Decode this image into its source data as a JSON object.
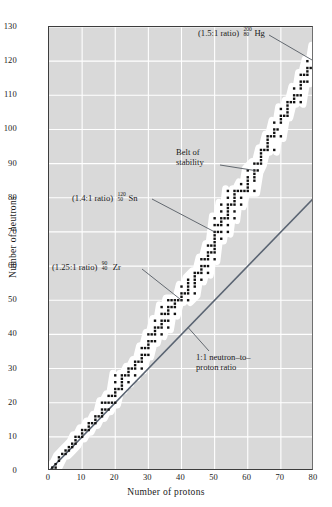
{
  "chart_data": {
    "type": "scatter",
    "title": "",
    "xlabel": "Number of protons",
    "ylabel": "Number of neutrons",
    "xlim": [
      0,
      80
    ],
    "ylim": [
      0,
      130
    ],
    "xticks": [
      0,
      10,
      20,
      30,
      40,
      50,
      60,
      70,
      80
    ],
    "yticks": [
      0,
      10,
      20,
      30,
      40,
      50,
      60,
      70,
      80,
      90,
      100,
      110,
      120,
      130
    ],
    "grid": true,
    "legend": "none",
    "background": "#d9d9d9",
    "gridline_color": "#ffffff",
    "point_color": "#111111",
    "band_color": "#ffffff",
    "reference_line_color": "#5a6472",
    "series": [
      {
        "name": "belt of stability (stable nuclides)",
        "note": "Z = protons, N = neutrons for stable isotopes",
        "points": [
          [
            1,
            0
          ],
          [
            1,
            1
          ],
          [
            2,
            1
          ],
          [
            2,
            2
          ],
          [
            3,
            3
          ],
          [
            3,
            4
          ],
          [
            4,
            5
          ],
          [
            5,
            5
          ],
          [
            5,
            6
          ],
          [
            6,
            6
          ],
          [
            6,
            7
          ],
          [
            7,
            7
          ],
          [
            7,
            8
          ],
          [
            8,
            8
          ],
          [
            8,
            9
          ],
          [
            8,
            10
          ],
          [
            9,
            10
          ],
          [
            10,
            10
          ],
          [
            10,
            11
          ],
          [
            10,
            12
          ],
          [
            11,
            12
          ],
          [
            12,
            12
          ],
          [
            12,
            13
          ],
          [
            12,
            14
          ],
          [
            13,
            14
          ],
          [
            14,
            14
          ],
          [
            14,
            15
          ],
          [
            14,
            16
          ],
          [
            15,
            16
          ],
          [
            16,
            16
          ],
          [
            16,
            17
          ],
          [
            16,
            18
          ],
          [
            16,
            20
          ],
          [
            17,
            18
          ],
          [
            17,
            20
          ],
          [
            18,
            18
          ],
          [
            18,
            20
          ],
          [
            18,
            22
          ],
          [
            19,
            20
          ],
          [
            19,
            22
          ],
          [
            20,
            20
          ],
          [
            20,
            22
          ],
          [
            20,
            23
          ],
          [
            20,
            24
          ],
          [
            20,
            26
          ],
          [
            20,
            28
          ],
          [
            21,
            24
          ],
          [
            22,
            24
          ],
          [
            22,
            25
          ],
          [
            22,
            26
          ],
          [
            22,
            27
          ],
          [
            22,
            28
          ],
          [
            23,
            28
          ],
          [
            24,
            26
          ],
          [
            24,
            28
          ],
          [
            24,
            29
          ],
          [
            24,
            30
          ],
          [
            25,
            30
          ],
          [
            26,
            28
          ],
          [
            26,
            30
          ],
          [
            26,
            31
          ],
          [
            26,
            32
          ],
          [
            27,
            32
          ],
          [
            28,
            30
          ],
          [
            28,
            32
          ],
          [
            28,
            33
          ],
          [
            28,
            34
          ],
          [
            28,
            36
          ],
          [
            29,
            34
          ],
          [
            29,
            36
          ],
          [
            30,
            34
          ],
          [
            30,
            36
          ],
          [
            30,
            37
          ],
          [
            30,
            38
          ],
          [
            30,
            40
          ],
          [
            31,
            38
          ],
          [
            31,
            40
          ],
          [
            32,
            38
          ],
          [
            32,
            40
          ],
          [
            32,
            41
          ],
          [
            32,
            42
          ],
          [
            32,
            44
          ],
          [
            33,
            42
          ],
          [
            34,
            40
          ],
          [
            34,
            42
          ],
          [
            34,
            43
          ],
          [
            34,
            44
          ],
          [
            34,
            46
          ],
          [
            34,
            48
          ],
          [
            35,
            44
          ],
          [
            35,
            46
          ],
          [
            36,
            42
          ],
          [
            36,
            44
          ],
          [
            36,
            46
          ],
          [
            36,
            47
          ],
          [
            36,
            48
          ],
          [
            36,
            50
          ],
          [
            37,
            48
          ],
          [
            37,
            50
          ],
          [
            38,
            46
          ],
          [
            38,
            48
          ],
          [
            38,
            49
          ],
          [
            38,
            50
          ],
          [
            39,
            50
          ],
          [
            40,
            50
          ],
          [
            40,
            51
          ],
          [
            40,
            52
          ],
          [
            40,
            54
          ],
          [
            41,
            52
          ],
          [
            42,
            50
          ],
          [
            42,
            52
          ],
          [
            42,
            53
          ],
          [
            42,
            54
          ],
          [
            42,
            55
          ],
          [
            42,
            56
          ],
          [
            44,
            52
          ],
          [
            44,
            54
          ],
          [
            44,
            55
          ],
          [
            44,
            56
          ],
          [
            44,
            57
          ],
          [
            44,
            58
          ],
          [
            45,
            58
          ],
          [
            46,
            56
          ],
          [
            46,
            58
          ],
          [
            46,
            59
          ],
          [
            46,
            60
          ],
          [
            46,
            62
          ],
          [
            47,
            60
          ],
          [
            47,
            62
          ],
          [
            48,
            58
          ],
          [
            48,
            60
          ],
          [
            48,
            62
          ],
          [
            48,
            63
          ],
          [
            48,
            64
          ],
          [
            48,
            66
          ],
          [
            49,
            64
          ],
          [
            49,
            66
          ],
          [
            50,
            62
          ],
          [
            50,
            64
          ],
          [
            50,
            65
          ],
          [
            50,
            66
          ],
          [
            50,
            67
          ],
          [
            50,
            68
          ],
          [
            50,
            69
          ],
          [
            50,
            70
          ],
          [
            50,
            72
          ],
          [
            50,
            74
          ],
          [
            51,
            70
          ],
          [
            51,
            72
          ],
          [
            52,
            68
          ],
          [
            52,
            70
          ],
          [
            52,
            72
          ],
          [
            52,
            73
          ],
          [
            52,
            74
          ],
          [
            52,
            76
          ],
          [
            52,
            78
          ],
          [
            53,
            74
          ],
          [
            54,
            70
          ],
          [
            54,
            72
          ],
          [
            54,
            74
          ],
          [
            54,
            75
          ],
          [
            54,
            76
          ],
          [
            54,
            77
          ],
          [
            54,
            78
          ],
          [
            54,
            80
          ],
          [
            54,
            82
          ],
          [
            55,
            78
          ],
          [
            56,
            74
          ],
          [
            56,
            76
          ],
          [
            56,
            78
          ],
          [
            56,
            79
          ],
          [
            56,
            80
          ],
          [
            56,
            81
          ],
          [
            56,
            82
          ],
          [
            57,
            82
          ],
          [
            58,
            78
          ],
          [
            58,
            80
          ],
          [
            58,
            82
          ],
          [
            58,
            84
          ],
          [
            59,
            82
          ],
          [
            60,
            82
          ],
          [
            60,
            83
          ],
          [
            60,
            84
          ],
          [
            60,
            85
          ],
          [
            60,
            86
          ],
          [
            60,
            88
          ],
          [
            62,
            82
          ],
          [
            62,
            85
          ],
          [
            62,
            86
          ],
          [
            62,
            87
          ],
          [
            62,
            88
          ],
          [
            62,
            90
          ],
          [
            63,
            88
          ],
          [
            63,
            90
          ],
          [
            64,
            90
          ],
          [
            64,
            91
          ],
          [
            64,
            92
          ],
          [
            64,
            93
          ],
          [
            64,
            94
          ],
          [
            65,
            94
          ],
          [
            66,
            94
          ],
          [
            66,
            95
          ],
          [
            66,
            96
          ],
          [
            66,
            97
          ],
          [
            66,
            98
          ],
          [
            67,
            98
          ],
          [
            68,
            94
          ],
          [
            68,
            98
          ],
          [
            68,
            99
          ],
          [
            68,
            100
          ],
          [
            68,
            102
          ],
          [
            69,
            100
          ],
          [
            70,
            98
          ],
          [
            70,
            102
          ],
          [
            70,
            103
          ],
          [
            70,
            104
          ],
          [
            70,
            106
          ],
          [
            71,
            104
          ],
          [
            72,
            104
          ],
          [
            72,
            105
          ],
          [
            72,
            106
          ],
          [
            72,
            107
          ],
          [
            72,
            108
          ],
          [
            73,
            108
          ],
          [
            74,
            108
          ],
          [
            74,
            109
          ],
          [
            74,
            110
          ],
          [
            74,
            112
          ],
          [
            75,
            110
          ],
          [
            76,
            108
          ],
          [
            76,
            110
          ],
          [
            76,
            112
          ],
          [
            76,
            113
          ],
          [
            76,
            114
          ],
          [
            76,
            116
          ],
          [
            77,
            114
          ],
          [
            77,
            116
          ],
          [
            78,
            114
          ],
          [
            78,
            116
          ],
          [
            78,
            117
          ],
          [
            78,
            118
          ],
          [
            78,
            120
          ],
          [
            79,
            118
          ],
          [
            80,
            116
          ],
          [
            80,
            118
          ],
          [
            80,
            119
          ],
          [
            80,
            120
          ],
          [
            80,
            121
          ],
          [
            80,
            122
          ],
          [
            80,
            124
          ]
        ]
      }
    ],
    "reference_lines": [
      {
        "name": "1:1 neutron-to-proton ratio",
        "from": [
          0,
          0
        ],
        "to": [
          80,
          80
        ],
        "slope": 1
      }
    ],
    "annotations": [
      {
        "id": "hg",
        "ratio_text": "(1.5:1 ratio)",
        "mass_number": "200",
        "atomic_number": "80",
        "symbol": "Hg",
        "points_to": [
          80,
          120
        ]
      },
      {
        "id": "belt",
        "line1": "Belt of",
        "line2": "stability",
        "points_to": [
          62,
          88
        ]
      },
      {
        "id": "sn",
        "ratio_text": "(1.4:1 ratio)",
        "mass_number": "120",
        "atomic_number": "50",
        "symbol": "Sn",
        "points_to": [
          50,
          70
        ]
      },
      {
        "id": "zr",
        "ratio_text": "(1.25:1 ratio)",
        "mass_number": "90",
        "atomic_number": "40",
        "symbol": "Zr",
        "points_to": [
          40,
          50
        ]
      },
      {
        "id": "ratio11",
        "line1": "1:1 neutron–to–",
        "line2": "proton ratio",
        "points_to": [
          42,
          42
        ]
      }
    ]
  }
}
